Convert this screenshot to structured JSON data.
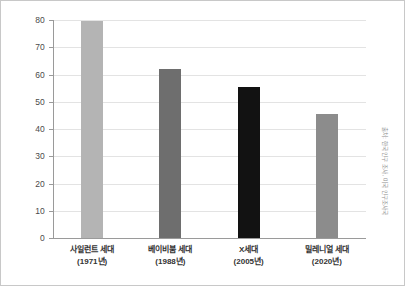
{
  "chart_data": {
    "type": "bar",
    "title": "",
    "xlabel": "",
    "ylabel": "",
    "ylim": [
      0,
      80
    ],
    "yticks": [
      0,
      10,
      20,
      30,
      40,
      50,
      60,
      70,
      80
    ],
    "grid": true,
    "legend": "none",
    "categories": [
      "사일런트 세대",
      "베이비붐 세대",
      "X세대",
      "밀레니얼 세대"
    ],
    "category_sublabels": [
      "(1971년)",
      "(1988년)",
      "(2005년)",
      "(2020년)"
    ],
    "values": [
      79.5,
      62.2,
      55.3,
      45.5
    ],
    "bar_colors": [
      "#b4b4b4",
      "#6e6e6e",
      "#121212",
      "#8c8c8c"
    ],
    "annotation": "출처: 한국 인구 조사, 미국 인구조사국"
  },
  "axis": {
    "tick_labels": [
      "80",
      "70",
      "60",
      "50",
      "40",
      "30",
      "20",
      "10",
      "0"
    ]
  },
  "colors": {
    "gridline": "#e3e3e3",
    "axis": "#9a9a9a",
    "border": "#c8c8c8",
    "tick_text": "#4a4a4a",
    "category_text": "#333333",
    "note_text": "#8d8d8d"
  }
}
